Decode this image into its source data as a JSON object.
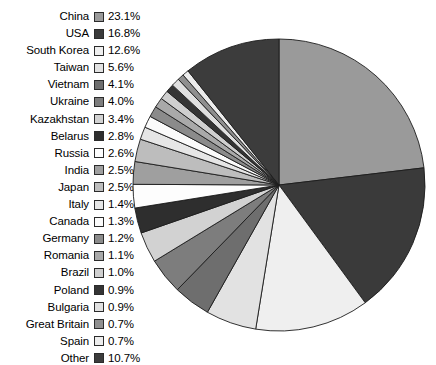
{
  "chart_data": {
    "type": "pie",
    "title": "",
    "subtitle": "",
    "xlabel": "",
    "ylabel": "",
    "legend_position": "left",
    "grid": false,
    "units": "%",
    "start_angle_deg": 0,
    "direction": "clockwise",
    "categories": [
      "China",
      "USA",
      "South Korea",
      "Taiwan",
      "Vietnam",
      "Ukraine",
      "Kazakhstan",
      "Belarus",
      "Russia",
      "India",
      "Japan",
      "Italy",
      "Canada",
      "Germany",
      "Romania",
      "Brazil",
      "Poland",
      "Bulgaria",
      "Great Britain",
      "Spain",
      "Other"
    ],
    "values": [
      23.1,
      16.8,
      12.6,
      5.6,
      4.1,
      4.0,
      3.4,
      2.8,
      2.6,
      2.5,
      2.5,
      1.4,
      1.3,
      1.2,
      1.1,
      1.0,
      0.9,
      0.9,
      0.7,
      0.7,
      10.7
    ],
    "colors": [
      "#9a9a9a",
      "#3a3a3a",
      "#efefef",
      "#e2e2e2",
      "#6e6e6e",
      "#7d7d7d",
      "#d2d2d2",
      "#2e2e2e",
      "#fdfdfd",
      "#9f9f9f",
      "#bdbdbd",
      "#e6e6e6",
      "#fbfbfb",
      "#8b8b8b",
      "#a9a9a9",
      "#cfcfcf",
      "#343434",
      "#e0e0e0",
      "#8f8f8f",
      "#ededed",
      "#3c3c3c"
    ],
    "slices": [
      {
        "label": "China",
        "value": 23.1,
        "display": "23.1%",
        "color": "#9a9a9a"
      },
      {
        "label": "USA",
        "value": 16.8,
        "display": "16.8%",
        "color": "#3a3a3a"
      },
      {
        "label": "South Korea",
        "value": 12.6,
        "display": "12.6%",
        "color": "#efefef"
      },
      {
        "label": "Taiwan",
        "value": 5.6,
        "display": "5.6%",
        "color": "#e2e2e2"
      },
      {
        "label": "Vietnam",
        "value": 4.1,
        "display": "4.1%",
        "color": "#6e6e6e"
      },
      {
        "label": "Ukraine",
        "value": 4.0,
        "display": "4.0%",
        "color": "#7d7d7d"
      },
      {
        "label": "Kazakhstan",
        "value": 3.4,
        "display": "3.4%",
        "color": "#d2d2d2"
      },
      {
        "label": "Belarus",
        "value": 2.8,
        "display": "2.8%",
        "color": "#2e2e2e"
      },
      {
        "label": "Russia",
        "value": 2.6,
        "display": "2.6%",
        "color": "#fdfdfd"
      },
      {
        "label": "India",
        "value": 2.5,
        "display": "2.5%",
        "color": "#9f9f9f"
      },
      {
        "label": "Japan",
        "value": 2.5,
        "display": "2.5%",
        "color": "#bdbdbd"
      },
      {
        "label": "Italy",
        "value": 1.4,
        "display": "1.4%",
        "color": "#e6e6e6"
      },
      {
        "label": "Canada",
        "value": 1.3,
        "display": "1.3%",
        "color": "#fbfbfb"
      },
      {
        "label": "Germany",
        "value": 1.2,
        "display": "1.2%",
        "color": "#8b8b8b"
      },
      {
        "label": "Romania",
        "value": 1.1,
        "display": "1.1%",
        "color": "#a9a9a9"
      },
      {
        "label": "Brazil",
        "value": 1.0,
        "display": "1.0%",
        "color": "#cfcfcf"
      },
      {
        "label": "Poland",
        "value": 0.9,
        "display": "0.9%",
        "color": "#343434"
      },
      {
        "label": "Bulgaria",
        "value": 0.9,
        "display": "0.9%",
        "color": "#e0e0e0"
      },
      {
        "label": "Great Britain",
        "value": 0.7,
        "display": "0.7%",
        "color": "#8f8f8f"
      },
      {
        "label": "Spain",
        "value": 0.7,
        "display": "0.7%",
        "color": "#ededed"
      },
      {
        "label": "Other",
        "value": 10.7,
        "display": "10.7%",
        "color": "#3c3c3c"
      }
    ]
  },
  "pie": {
    "center_x": 147,
    "center_y": 147,
    "radius": 146,
    "outline_color": "#1c1c1c"
  }
}
